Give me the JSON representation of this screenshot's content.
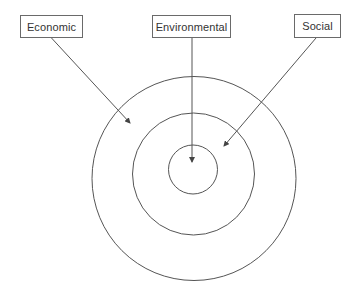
{
  "diagram": {
    "type": "concentric-circles-with-labeled-arrows",
    "labels": [
      {
        "id": "economic",
        "text": "Economic",
        "points_to": "outer-ring"
      },
      {
        "id": "environmental",
        "text": "Environmental",
        "points_to": "inner-circle"
      },
      {
        "id": "social",
        "text": "Social",
        "points_to": "middle-ring"
      }
    ],
    "circles": [
      {
        "id": "outer-ring",
        "cx": 194,
        "cy": 178,
        "r": 102
      },
      {
        "id": "middle-ring",
        "cx": 193,
        "cy": 174,
        "r": 61
      },
      {
        "id": "inner-circle",
        "cx": 193,
        "cy": 169,
        "r": 24
      }
    ],
    "colors": {
      "stroke": "#555555",
      "text": "#333333",
      "box_border": "#6a6a6a",
      "background": "#ffffff"
    }
  }
}
